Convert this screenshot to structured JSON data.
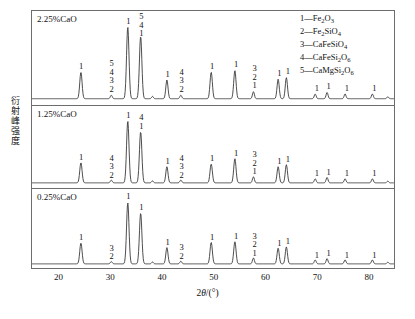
{
  "axes": {
    "ylabel": "衍射峰强度",
    "xlabel_pre": "2",
    "xlabel_theta": "θ",
    "xlabel_post": "/(°)",
    "xlabel_full": "2θ/(°)",
    "xlim": [
      14.7,
      85.0
    ],
    "xticks": [
      20,
      30,
      40,
      50,
      60,
      70,
      80
    ],
    "xtick_labels": [
      "20",
      "30",
      "40",
      "50",
      "60",
      "70",
      "80"
    ],
    "ylim": [
      0,
      100
    ],
    "ytick_labels": [],
    "grid": false,
    "frame_color": "#6d6d6d",
    "line_color": "#3a3a3a"
  },
  "legend": {
    "position": "top-right",
    "entries": [
      {
        "key": "1",
        "dash": "—",
        "formula_html": "Fe<sub>2</sub>O<sub>3</sub>",
        "formula": "Fe2O3",
        "text": "1—Fe2O3"
      },
      {
        "key": "2",
        "dash": "—",
        "formula_html": "Fe<sub>2</sub>SiO<sub>4</sub>",
        "formula": "Fe2SiO4",
        "text": "2—Fe2SiO4"
      },
      {
        "key": "3",
        "dash": "—",
        "formula_html": "CaFeSiO<sub>4</sub>",
        "formula": "CaFeSiO4",
        "text": "3—CaFeSiO4"
      },
      {
        "key": "4",
        "dash": "—",
        "formula_html": "CaFeSi<sub>2</sub>O<sub>6</sub>",
        "formula": "CaFeSi2O6",
        "text": "4—CaFeSi2O6"
      },
      {
        "key": "5",
        "dash": "—",
        "formula_html": "CaMgSi<sub>2</sub>O<sub>6</sub>",
        "formula": "CaMgSi2O6",
        "text": "5—CaMgSi2O6"
      }
    ]
  },
  "chart_data": {
    "type": "line",
    "title": "",
    "xlabel": "2θ/(°)",
    "ylabel": "衍射峰强度",
    "xlim": [
      14.7,
      85.0
    ],
    "ylim": [
      0,
      100
    ],
    "grid": false,
    "legend_position": "top-right",
    "panels": [
      {
        "label": "2.25%CaO",
        "name": "panel-2-25-cao",
        "baseline": 4,
        "peaks": [
          {
            "x": 24.2,
            "h": 34,
            "w": 0.36,
            "label": "1"
          },
          {
            "x": 30.1,
            "h": 4.5,
            "w": 0.3,
            "label": "5\n4\n3\n2"
          },
          {
            "x": 33.3,
            "h": 92,
            "w": 0.38,
            "label": "1"
          },
          {
            "x": 35.8,
            "h": 80,
            "w": 0.38,
            "label": "5\n4\n1"
          },
          {
            "x": 38.1,
            "h": 3.0,
            "w": 0.28,
            "label": ""
          },
          {
            "x": 40.9,
            "h": 24,
            "w": 0.34,
            "label": "1"
          },
          {
            "x": 43.6,
            "h": 4.5,
            "w": 0.3,
            "label": "4\n3\n2"
          },
          {
            "x": 49.5,
            "h": 34,
            "w": 0.36,
            "label": "1"
          },
          {
            "x": 54.1,
            "h": 36,
            "w": 0.36,
            "label": "1"
          },
          {
            "x": 57.7,
            "h": 9,
            "w": 0.3,
            "label": "3\n2\n1"
          },
          {
            "x": 62.5,
            "h": 25,
            "w": 0.34,
            "label": "1"
          },
          {
            "x": 64.1,
            "h": 27,
            "w": 0.34,
            "label": "1"
          },
          {
            "x": 69.7,
            "h": 6,
            "w": 0.3,
            "label": "1"
          },
          {
            "x": 72.0,
            "h": 8,
            "w": 0.3,
            "label": "1"
          },
          {
            "x": 75.5,
            "h": 6,
            "w": 0.3,
            "label": "1"
          },
          {
            "x": 80.8,
            "h": 6,
            "w": 0.3,
            "label": "1"
          },
          {
            "x": 83.8,
            "h": 2.5,
            "w": 0.28,
            "label": ""
          }
        ]
      },
      {
        "label": "1.25%CaO",
        "name": "panel-1-25-cao",
        "baseline": 4,
        "peaks": [
          {
            "x": 24.2,
            "h": 30,
            "w": 0.36,
            "label": "1"
          },
          {
            "x": 30.1,
            "h": 4.0,
            "w": 0.3,
            "label": "4\n3\n2"
          },
          {
            "x": 33.3,
            "h": 92,
            "w": 0.38,
            "label": "1"
          },
          {
            "x": 35.8,
            "h": 76,
            "w": 0.38,
            "label": "4\n1"
          },
          {
            "x": 38.1,
            "h": 3.0,
            "w": 0.28,
            "label": ""
          },
          {
            "x": 40.9,
            "h": 24,
            "w": 0.34,
            "label": "1"
          },
          {
            "x": 43.6,
            "h": 4.0,
            "w": 0.3,
            "label": "4\n3\n2"
          },
          {
            "x": 49.5,
            "h": 28,
            "w": 0.36,
            "label": "1"
          },
          {
            "x": 54.1,
            "h": 36,
            "w": 0.36,
            "label": "1"
          },
          {
            "x": 57.7,
            "h": 9,
            "w": 0.3,
            "label": "3\n2\n1"
          },
          {
            "x": 62.5,
            "h": 24,
            "w": 0.34,
            "label": "1"
          },
          {
            "x": 64.1,
            "h": 27,
            "w": 0.34,
            "label": "1"
          },
          {
            "x": 69.7,
            "h": 6,
            "w": 0.3,
            "label": "1"
          },
          {
            "x": 72.0,
            "h": 8,
            "w": 0.3,
            "label": "1"
          },
          {
            "x": 75.5,
            "h": 6,
            "w": 0.3,
            "label": "1"
          },
          {
            "x": 80.8,
            "h": 6,
            "w": 0.3,
            "label": "1"
          },
          {
            "x": 83.8,
            "h": 2.5,
            "w": 0.28,
            "label": ""
          }
        ]
      },
      {
        "label": "0.25%CaO",
        "name": "panel-0-25-cao",
        "baseline": 4,
        "peaks": [
          {
            "x": 24.2,
            "h": 32,
            "w": 0.36,
            "label": "1"
          },
          {
            "x": 30.1,
            "h": 3.5,
            "w": 0.3,
            "label": "3\n2"
          },
          {
            "x": 33.3,
            "h": 94,
            "w": 0.38,
            "label": "1"
          },
          {
            "x": 35.8,
            "h": 78,
            "w": 0.38,
            "label": "1"
          },
          {
            "x": 38.1,
            "h": 3.0,
            "w": 0.28,
            "label": ""
          },
          {
            "x": 40.9,
            "h": 25,
            "w": 0.34,
            "label": "1"
          },
          {
            "x": 43.6,
            "h": 4.0,
            "w": 0.3,
            "label": "3\n2"
          },
          {
            "x": 49.5,
            "h": 33,
            "w": 0.36,
            "label": "1"
          },
          {
            "x": 54.1,
            "h": 34,
            "w": 0.36,
            "label": "1"
          },
          {
            "x": 57.7,
            "h": 9,
            "w": 0.3,
            "label": "3\n2\n1"
          },
          {
            "x": 62.5,
            "h": 24,
            "w": 0.34,
            "label": "1"
          },
          {
            "x": 64.1,
            "h": 26,
            "w": 0.34,
            "label": "1"
          },
          {
            "x": 69.7,
            "h": 6,
            "w": 0.3,
            "label": "1"
          },
          {
            "x": 72.0,
            "h": 8,
            "w": 0.3,
            "label": "1"
          },
          {
            "x": 75.5,
            "h": 6,
            "w": 0.3,
            "label": "1"
          },
          {
            "x": 80.8,
            "h": 6,
            "w": 0.3,
            "label": "1"
          },
          {
            "x": 83.8,
            "h": 2.5,
            "w": 0.28,
            "label": ""
          }
        ]
      }
    ]
  }
}
